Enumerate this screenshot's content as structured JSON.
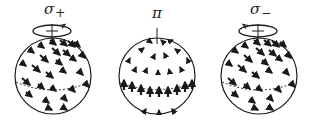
{
  "diagram": {
    "panels": [
      {
        "id": "sigma-plus",
        "label_symbol": "σ",
        "label_sub": "+",
        "has_rotation_loop": true,
        "rotation_direction": "counterclockwise-viewed-from-top",
        "arrow_field": "diagonal-down-right",
        "center_x": 53,
        "label_x": 44
      },
      {
        "id": "pi",
        "label_symbol": "π",
        "label_sub": "",
        "has_rotation_loop": false,
        "arrow_field": "vertical-up-near-equator",
        "center_x": 157,
        "label_x": 152
      },
      {
        "id": "sigma-minus",
        "label_symbol": "σ",
        "label_sub": "−",
        "has_rotation_loop": true,
        "rotation_direction": "clockwise-viewed-from-top",
        "arrow_field": "diagonal-down-right",
        "center_x": 258,
        "label_x": 250
      }
    ],
    "colors": {
      "stroke": "#1a1a1a",
      "background": "#ffffff"
    }
  }
}
